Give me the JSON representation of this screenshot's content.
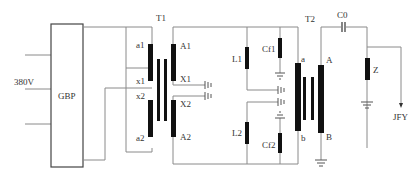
{
  "diagram": {
    "type": "circuit-schematic",
    "colors": {
      "wire": "#8a8a8a",
      "component": "#111111",
      "text": "#333333"
    },
    "blocks": {
      "gbp": {
        "label": "GBP"
      },
      "source": {
        "label": "380V"
      }
    },
    "transformers": {
      "t1": {
        "label": "T1",
        "primary_terminals": [
          "a1",
          "x1",
          "x2",
          "a2"
        ],
        "secondary_terminals": [
          "A1",
          "X1",
          "X2",
          "A2"
        ]
      },
      "t2": {
        "label": "T2",
        "primary_terminals": [
          "a",
          "b"
        ],
        "secondary_terminals": [
          "A",
          "B"
        ]
      }
    },
    "components": {
      "l1": "L1",
      "l2": "L2",
      "cf1": "Cf1",
      "cf2": "Cf2",
      "c0": "C0",
      "z": "Z",
      "output": "JFY"
    }
  }
}
